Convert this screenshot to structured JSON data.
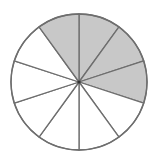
{
  "chart_data": {
    "type": "pie",
    "title": "",
    "total_parts": 10,
    "shaded_parts": 4,
    "fraction": "4/10",
    "slice_angle_deg": 36,
    "shaded_slices_clockwise_from_top": [
      -1,
      0,
      1,
      2
    ],
    "categories": [
      "shaded",
      "unshaded"
    ],
    "values": [
      4,
      6
    ],
    "colors": {
      "shaded": "#c8c8c8",
      "unshaded": "#ffffff",
      "stroke": "#6e6e6e"
    },
    "geometry": {
      "cx": 79,
      "cy": 82,
      "r": 68
    }
  }
}
